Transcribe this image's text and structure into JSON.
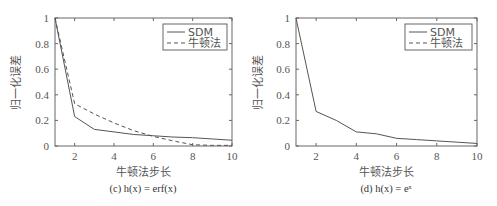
{
  "chart_data": [
    {
      "type": "line",
      "caption_prefix": "(c) ",
      "caption_func": "h(x) = erf(x)",
      "caption": "(c) h(x) = erf(x)",
      "xlabel": "牛顿法步长",
      "ylabel": "归一化误差",
      "xlim": [
        1,
        10
      ],
      "ylim": [
        0,
        1
      ],
      "xticks": [
        "2",
        "4",
        "6",
        "8",
        "10"
      ],
      "yticks": [
        "0",
        "0.2",
        "0.4",
        "0.6",
        "0.8",
        "1"
      ],
      "legend": [
        "SDM",
        "牛顿法"
      ],
      "legend_position": "upper right",
      "x": [
        1,
        2,
        3,
        4,
        5,
        6,
        7,
        8,
        9,
        10
      ],
      "series": [
        {
          "name": "SDM",
          "style": "solid",
          "values": [
            1.0,
            0.23,
            0.13,
            0.11,
            0.09,
            0.08,
            0.07,
            0.065,
            0.055,
            0.045
          ]
        },
        {
          "name": "牛顿法",
          "style": "dashed",
          "values": [
            1.0,
            0.33,
            0.25,
            0.18,
            0.12,
            0.075,
            0.04,
            0.01,
            0.005,
            0.005
          ]
        }
      ]
    },
    {
      "type": "line",
      "caption_prefix": "(d) ",
      "caption_func": "h(x) = eˣ",
      "caption": "(d) h(x) = e^x",
      "xlabel": "牛顿法步长",
      "ylabel": "归一化误差",
      "xlim": [
        1,
        10
      ],
      "ylim": [
        0,
        1
      ],
      "xticks": [
        "2",
        "4",
        "6",
        "8",
        "10"
      ],
      "yticks": [
        "0",
        "0.2",
        "0.4",
        "0.6",
        "0.8",
        "1"
      ],
      "legend": [
        "SDM",
        "牛顿法"
      ],
      "legend_position": "upper right",
      "x": [
        1,
        2,
        3,
        4,
        5,
        6,
        7,
        8,
        9,
        10
      ],
      "series": [
        {
          "name": "SDM",
          "style": "solid",
          "values": [
            1.0,
            0.27,
            0.2,
            0.11,
            0.095,
            0.06,
            0.05,
            0.04,
            0.03,
            0.02
          ]
        },
        {
          "name": "牛顿法",
          "style": "dashed",
          "values": []
        }
      ]
    }
  ]
}
